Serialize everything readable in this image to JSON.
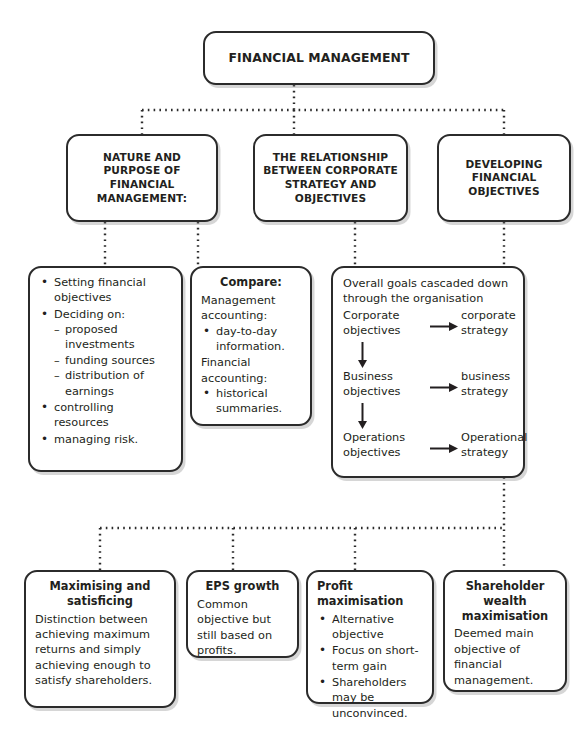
{
  "diagram": {
    "title_node": {
      "label": "FINANCIAL MANAGEMENT"
    },
    "branches": [
      {
        "id": "nature",
        "label": "NATURE AND\nPURPOSE OF\nFINANCIAL\nMANAGEMENT:"
      },
      {
        "id": "relationship",
        "label": "THE RELATIONSHIP\nBETWEEN CORPORATE\nSTRATEGY AND\nOBJECTIVES"
      },
      {
        "id": "developing",
        "label": "DEVELOPING\nFINANCIAL\nOBJECTIVES"
      }
    ],
    "detail_nature": {
      "items": [
        {
          "text": "Setting financial objectives",
          "sub": []
        },
        {
          "text": "Deciding on:",
          "sub": [
            "proposed investments",
            "funding sources",
            "distribution of earnings"
          ]
        },
        {
          "text": "controlling resources",
          "sub": []
        },
        {
          "text": "managing risk.",
          "sub": []
        }
      ]
    },
    "detail_compare": {
      "heading": "Compare:",
      "group_one_label": "Management accounting:",
      "group_one_items": [
        "day-to-day information."
      ],
      "group_two_label": "Financial accounting:",
      "group_two_items": [
        "historical summaries."
      ]
    },
    "detail_cascade": {
      "intro": "Overall goals cascaded down through the organisation",
      "rows": [
        {
          "objective": "Corporate objectives",
          "strategy": "corporate strategy"
        },
        {
          "objective": "Business objectives",
          "strategy": "business strategy"
        },
        {
          "objective": "Operations objectives",
          "strategy": "Operational strategy"
        }
      ],
      "right_arrow_icon": "arrow-right-icon",
      "down_arrow_icon": "arrow-down-icon"
    },
    "objectives": [
      {
        "id": "maximising",
        "heading": "Maximising and satisficing",
        "heading_align": "center",
        "body": "Distinction between achieving maximum returns and simply achieving enough to satisfy shareholders.",
        "bullets": []
      },
      {
        "id": "eps",
        "heading": "EPS growth",
        "heading_align": "center",
        "body": "Common objective but still based on profits.",
        "bullets": []
      },
      {
        "id": "profit",
        "heading": "Profit maximisation",
        "heading_align": "left",
        "body": "",
        "bullets": [
          "Alternative objective",
          "Focus on short-term gain",
          "Shareholders may be unconvinced."
        ]
      },
      {
        "id": "shareholder",
        "heading": "Shareholder wealth maximisation",
        "heading_align": "center",
        "body": "Deemed main objective of financial management.",
        "bullets": []
      }
    ],
    "style": {
      "line_color": "#2b2b2b",
      "box_border_color": "#2b2b2b",
      "text_color": "#231f20",
      "background": "#ffffff",
      "connector_style": "dotted"
    }
  }
}
